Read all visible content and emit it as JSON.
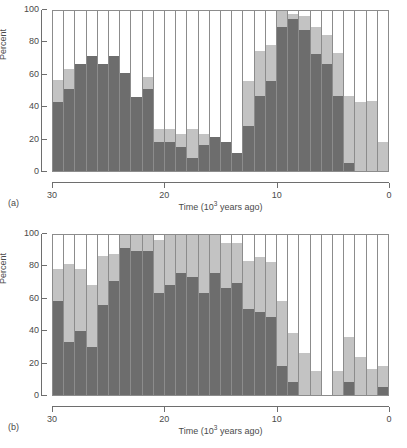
{
  "figure": {
    "panel_a_tag": "(a)",
    "panel_b_tag": "(b)"
  },
  "axes": {
    "ylabel": "Percent",
    "xlabel_prefix": "Time (10",
    "xlabel_sup": "3",
    "xlabel_suffix": " years ago)",
    "yticks": [
      "0",
      "20",
      "40",
      "60",
      "80",
      "100"
    ],
    "xticks": [
      "30",
      "20",
      "10",
      "0"
    ]
  },
  "colors": {
    "dark": "#6d6d6d",
    "light": "#c3c3c3",
    "empty": "#ffffff",
    "frame": "#8c8c8c",
    "axis": "#6e6e6e",
    "text": "#4a4a4a"
  },
  "chart_data": [
    {
      "type": "bar",
      "panel": "(a)",
      "title": "",
      "xlabel": "Time (10^3 years ago)",
      "ylabel": "Percent",
      "ylim": [
        0,
        100
      ],
      "xlim": [
        30,
        0
      ],
      "x_reversed": true,
      "grid": false,
      "legend": "none",
      "stacked": true,
      "bin_width": 1,
      "categories": [
        30,
        29,
        28,
        27,
        26,
        25,
        24,
        23,
        22,
        21,
        20,
        19,
        18,
        17,
        16,
        15,
        14,
        13,
        12,
        11,
        10,
        9,
        8,
        7,
        6,
        5,
        4,
        3,
        2,
        1
      ],
      "series": [
        {
          "name": "dark",
          "values": [
            43,
            51,
            67,
            72,
            67,
            72,
            61,
            46,
            51,
            18,
            18,
            15,
            8,
            16,
            21,
            18,
            11,
            28,
            47,
            56,
            90,
            95,
            88,
            73,
            67,
            47,
            5,
            0,
            0,
            0
          ]
        },
        {
          "name": "light",
          "values": [
            14,
            13,
            0,
            0,
            0,
            0,
            0,
            0,
            8,
            8,
            8,
            8,
            18,
            7,
            0,
            0,
            0,
            28,
            28,
            23,
            10,
            3,
            9,
            17,
            18,
            27,
            42,
            43,
            44,
            18
          ]
        }
      ],
      "totals": [
        57,
        64,
        67,
        72,
        67,
        72,
        61,
        46,
        59,
        26,
        26,
        23,
        26,
        23,
        21,
        18,
        11,
        56,
        75,
        79,
        100,
        98,
        97,
        90,
        85,
        74,
        47,
        43,
        44,
        18
      ]
    },
    {
      "type": "bar",
      "panel": "(b)",
      "title": "",
      "xlabel": "Time (10^3 years ago)",
      "ylabel": "Percent",
      "ylim": [
        0,
        100
      ],
      "xlim": [
        30,
        0
      ],
      "x_reversed": true,
      "grid": false,
      "legend": "none",
      "stacked": true,
      "bin_width": 1,
      "categories": [
        30,
        29,
        28,
        27,
        26,
        25,
        24,
        23,
        22,
        21,
        20,
        19,
        18,
        17,
        16,
        15,
        14,
        13,
        12,
        11,
        10,
        9,
        8,
        7,
        6,
        5,
        4,
        3,
        2,
        1
      ],
      "series": [
        {
          "name": "dark",
          "values": [
            59,
            33,
            40,
            30,
            56,
            71,
            92,
            90,
            90,
            64,
            69,
            76,
            74,
            64,
            76,
            67,
            70,
            54,
            52,
            49,
            18,
            8,
            0,
            0,
            0,
            0,
            8,
            0,
            0,
            5
          ]
        },
        {
          "name": "light",
          "values": [
            20,
            49,
            39,
            39,
            31,
            17,
            8,
            10,
            10,
            33,
            31,
            24,
            26,
            36,
            24,
            28,
            25,
            30,
            34,
            34,
            41,
            31,
            26,
            15,
            0,
            15,
            28,
            24,
            16,
            13
          ]
        }
      ],
      "totals": [
        79,
        82,
        79,
        69,
        87,
        88,
        100,
        100,
        100,
        97,
        100,
        100,
        100,
        100,
        100,
        95,
        95,
        84,
        86,
        83,
        59,
        39,
        26,
        15,
        0,
        15,
        36,
        24,
        16,
        18
      ]
    }
  ]
}
